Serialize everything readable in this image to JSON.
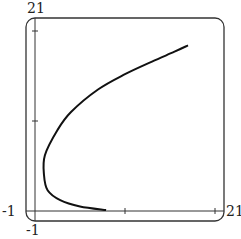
{
  "chart_data": {
    "type": "line",
    "title": "",
    "xlabel": "",
    "ylabel": "",
    "xlim": [
      -1,
      21
    ],
    "ylim": [
      -1,
      21
    ],
    "grid": false,
    "legend": null,
    "tick_labels": {
      "x_min": "-1",
      "x_max": "21",
      "y_min": "-1",
      "y_max": "21"
    },
    "x_ticks": [
      10,
      20
    ],
    "y_ticks": [
      10,
      20
    ],
    "series": [
      {
        "name": "parametric curve",
        "x": [
          7.9,
          5.0,
          2.8,
          1.4,
          1.0,
          1.1,
          2.5,
          4.0,
          7.0,
          10.0,
          13.0,
          15.5,
          17.0
        ],
        "y": [
          0.1,
          0.5,
          1.2,
          2.3,
          4.0,
          6.2,
          9.0,
          11.0,
          13.5,
          15.2,
          16.6,
          17.7,
          18.4
        ]
      }
    ]
  }
}
